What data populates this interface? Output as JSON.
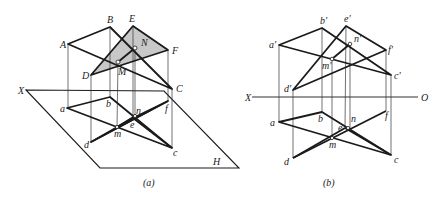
{
  "figure_a": {
    "caption": "(a)",
    "plane_label": "H",
    "axis_label": "X",
    "space_points": {
      "A": "A",
      "B": "B",
      "C": "C",
      "D": "D",
      "E": "E",
      "F": "F",
      "M": "M",
      "N": "N"
    },
    "projections": {
      "a": "a",
      "b": "b",
      "c": "c",
      "d": "d",
      "e": "e",
      "f": "f",
      "m": "m",
      "n": "n"
    },
    "shaded_triangle": "DEF",
    "shade_color": "#c8c8c8"
  },
  "figure_b": {
    "caption": "(b)",
    "axis_left": "X",
    "axis_right": "O",
    "front_view": {
      "a": "a'",
      "b": "b'",
      "c": "c'",
      "d": "d'",
      "e": "e'",
      "f": "f'",
      "m": "m'",
      "n": "n'"
    },
    "top_view": {
      "a": "a",
      "b": "b",
      "c": "c",
      "d": "d",
      "e": "e",
      "f": "f",
      "m": "m",
      "n": "n"
    }
  }
}
